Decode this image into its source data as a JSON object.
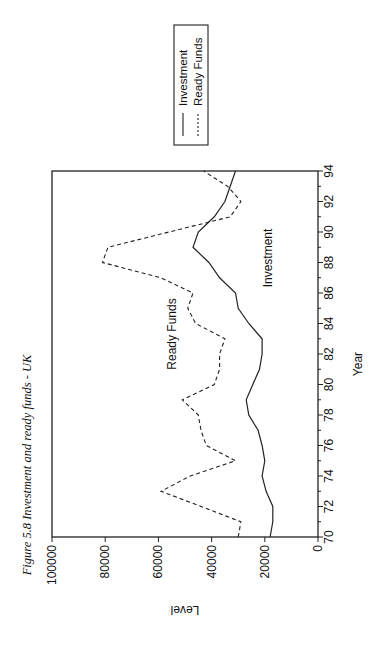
{
  "figure": {
    "title": "Figure 5.8 Investment and ready funds - UK",
    "orientation": "rotated 90 degrees counter-clockwise (landscape chart printed on portrait page)"
  },
  "legend": {
    "items": [
      {
        "label": "Investment",
        "style": "solid"
      },
      {
        "label": "Ready Funds",
        "style": "dashed"
      }
    ]
  },
  "annotations": {
    "ready_funds": "Ready Funds",
    "investment": "Investment"
  },
  "axes": {
    "x_label": "Year",
    "y_label": "Level",
    "x_ticks": [
      "70",
      "72",
      "74",
      "76",
      "78",
      "80",
      "82",
      "84",
      "86",
      "88",
      "90",
      "92",
      "94"
    ],
    "y_ticks": [
      "0",
      "20000",
      "40000",
      "60000",
      "80000",
      "100000"
    ]
  },
  "colors": {
    "line": "#222222",
    "frame": "#222222",
    "text": "#111111"
  },
  "chart_data": {
    "type": "line",
    "title": "Figure 5.8 Investment and ready funds - UK",
    "xlabel": "Year",
    "ylabel": "Level",
    "xlim": [
      70,
      94
    ],
    "ylim": [
      0,
      100000
    ],
    "x_ticks": [
      70,
      72,
      74,
      76,
      78,
      80,
      82,
      84,
      86,
      88,
      90,
      92,
      94
    ],
    "y_ticks": [
      0,
      20000,
      40000,
      60000,
      80000,
      100000
    ],
    "grid": false,
    "legend_position": "outside top-right (upper-right of rotated figure)",
    "x": [
      70,
      71,
      72,
      73,
      74,
      75,
      76,
      77,
      78,
      79,
      80,
      81,
      82,
      83,
      84,
      85,
      86,
      87,
      88,
      89,
      90,
      91,
      92,
      93,
      94
    ],
    "series": [
      {
        "name": "Investment",
        "style": "solid",
        "values": [
          18000,
          17000,
          17000,
          19500,
          21000,
          20000,
          21000,
          22500,
          26000,
          27000,
          24500,
          22000,
          21000,
          21000,
          26000,
          30000,
          31000,
          37000,
          41000,
          47000,
          45000,
          39000,
          35000,
          33000,
          31000
        ]
      },
      {
        "name": "Ready Funds",
        "style": "dashed",
        "values": [
          30000,
          29000,
          44000,
          59000,
          48000,
          31000,
          42000,
          44000,
          45000,
          51000,
          39000,
          37000,
          37000,
          35000,
          46000,
          49000,
          47000,
          59000,
          81000,
          79000,
          56000,
          33000,
          29000,
          34000,
          43000
        ]
      }
    ]
  }
}
